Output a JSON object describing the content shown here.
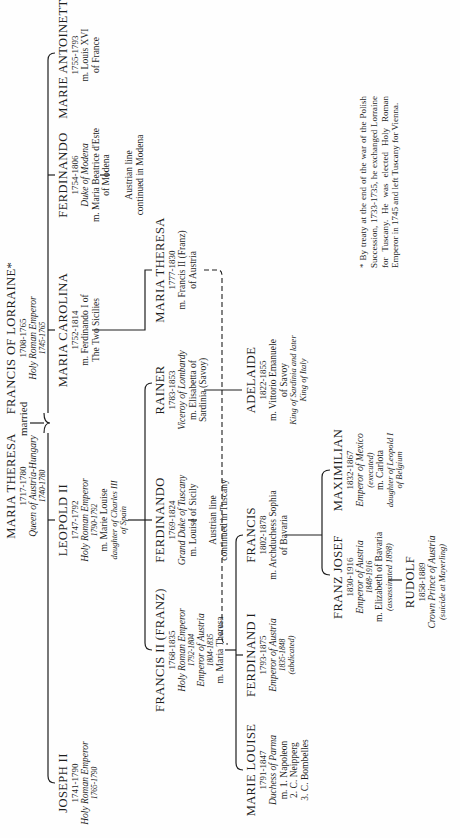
{
  "chart": {
    "type": "family-tree",
    "orientation": "rotated-90-ccw",
    "couple": {
      "wife": {
        "name": "MARIA THERESA",
        "dates": "1717-1780",
        "title": "Queen of Austria-Hungary",
        "reign": "1740-1780"
      },
      "connector": "married",
      "husband": {
        "name": "FRANCIS OF LORRAINE*",
        "dates": "1708-1765",
        "title": "Holy Roman Emperor",
        "reign": "1745-1765"
      }
    },
    "children": [
      {
        "name": "JOSEPH II",
        "dates": "1741-1790",
        "title": "Holy Roman Emperor",
        "reign": "1765-1790"
      },
      {
        "name": "LEOPOLD II",
        "dates": "1747-1792",
        "title": "Holy Roman Emperor",
        "reign": "1790-1792",
        "spouse": "m. Marie Louise",
        "spouse_note": "daughter of Charles III",
        "spouse_note2": "of Spain"
      },
      {
        "name": "MARIA CAROLINA",
        "dates": "1752-1814",
        "spouse": "m. Ferdinando I of",
        "spouse2": "The Two Sicilies"
      },
      {
        "name": "FERDINANDO",
        "dates": "1754-1806",
        "title": "Duke of Modena",
        "spouse": "m. Maria Beatrice d'Este",
        "spouse2": "of Modena",
        "line1": "Austrian line",
        "line2": "continued in Modena"
      },
      {
        "name": "MARIE ANTOINETTE",
        "dates": "1755-1793",
        "spouse": "m. Louis XVI",
        "spouse2": "of France"
      }
    ],
    "grandchildren": [
      {
        "name": "FRANCIS II (FRANZ)",
        "dates": "1768-1835",
        "title": "Holy Roman Emperor",
        "reign": "1792-1804",
        "title2": "Emperor of Austria",
        "reign2": "1804-1835",
        "spouse": "m. Maria Theresa"
      },
      {
        "name": "FERDINANDO",
        "dates": "1769-1824",
        "title": "Grand Duke of Tuscany",
        "spouse": "m. Louise of Sicily",
        "line1": "Austrian line",
        "line2": "continued in Tuscany"
      },
      {
        "name": "RAINER",
        "dates": "1783-1853",
        "title": "Viceroy of Lombardy",
        "spouse": "m. Elisabetta of",
        "spouse2": "Sardinia (Savoy)"
      },
      {
        "name": "MARIA THERESA",
        "dates": "1777-1830",
        "spouse": "m. Francis II (Franz)",
        "spouse2": "of Austria"
      }
    ],
    "great_grandchildren": [
      {
        "name": "MARIE LOUISE",
        "dates": "1791-1847",
        "title": "Duchess of Parma",
        "spouse": "m. 1. Napoleon",
        "spouse2": "2. C. Neipperg",
        "spouse3": "3. C. Bombelles"
      },
      {
        "name": "FERDINAND I",
        "dates": "1793-1875",
        "title": "Emperor of Austria",
        "reign": "1835-1848",
        "note": "(abdicated)"
      },
      {
        "name": "FRANCIS",
        "dates": "1802-1878",
        "spouse": "m. Archduchess Sophia",
        "spouse2": "of Bavaria"
      },
      {
        "name": "ADELAIDE",
        "dates": "1822-1855",
        "spouse": "m. Vittorio Emanuele",
        "spouse2": "of Savoy",
        "title": "King of Sardinia and later",
        "title2": "King of Italy"
      }
    ],
    "fifth_generation": [
      {
        "name": "FRANZ JOSEF",
        "dates": "1830-1916",
        "title": "Emperor of Austria",
        "reign": "1848-1916",
        "spouse": "m. Elizabeth of Bavaria",
        "note": "(assassinated 1898)"
      },
      {
        "name": "MAXIMILIAN",
        "dates": "1832-1867",
        "title": "Emperor of Mexico",
        "note": "(executed)",
        "spouse": "m. Carlota",
        "spouse_note": "daughter of Leopold I",
        "spouse_note2": "of Belgium"
      }
    ],
    "sixth_generation": [
      {
        "name": "RUDOLF",
        "dates": "1858-1889",
        "title": "Crown Prince of Austria",
        "note": "(suicide at Mayerling)"
      }
    ],
    "footnote": "* By treaty at the end of the war of the Polish Succession, 1733-1735, he exchanged Lorraine for Tuscany. He was elected Holy Roman Emperor in 1745 and left Tuscany for Vienna.",
    "colors": {
      "ink": "#1e1e1e",
      "paper": "#fefefe"
    }
  }
}
